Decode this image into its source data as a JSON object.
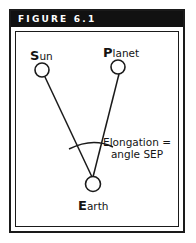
{
  "figure": {
    "header_label": "FIGURE 6.1",
    "colors": {
      "ink": "#1a1a1a",
      "header_background": "#111111",
      "header_text": "#ffffff",
      "page_background": "#ffffff"
    }
  },
  "diagram": {
    "type": "astronomy-elongation-diagram",
    "bodies": [
      {
        "id": "sun",
        "cap": "S",
        "rest": "un",
        "label": "Sun"
      },
      {
        "id": "planet",
        "cap": "P",
        "rest": "lanet",
        "label": "Planet"
      },
      {
        "id": "earth",
        "cap": "E",
        "rest": "arth",
        "label": "Earth"
      }
    ],
    "annotation": {
      "line1": "Elongation =",
      "line2": "angle SEP"
    }
  }
}
